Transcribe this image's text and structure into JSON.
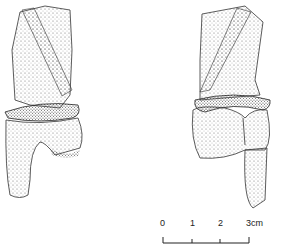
{
  "illustration": {
    "front_view": {
      "name": "figurine-front-view"
    },
    "back_view": {
      "name": "figurine-back-view"
    }
  },
  "scale_bar": {
    "ticks": [
      "0",
      "1",
      "2",
      "3"
    ],
    "unit": "cm",
    "last_label": "3cm"
  },
  "colors": {
    "ink": "#222222",
    "background": "#ffffff"
  }
}
